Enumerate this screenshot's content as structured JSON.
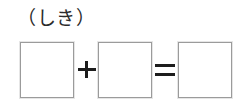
{
  "page": {
    "background_color": "#ffffff",
    "width": 242,
    "height": 107
  },
  "prompt": {
    "label": "（しき）"
  },
  "equation": {
    "boxes": [
      {
        "name": "first-addend",
        "value": ""
      },
      {
        "name": "second-addend",
        "value": ""
      },
      {
        "name": "sum",
        "value": ""
      }
    ],
    "operators": [
      {
        "name": "plus",
        "glyph": "+"
      },
      {
        "name": "equals",
        "glyph": "="
      }
    ],
    "box_border_color": "#9b9b9b",
    "box_fill_color": "#ffffff",
    "operator_color": "#1c1c1c"
  }
}
